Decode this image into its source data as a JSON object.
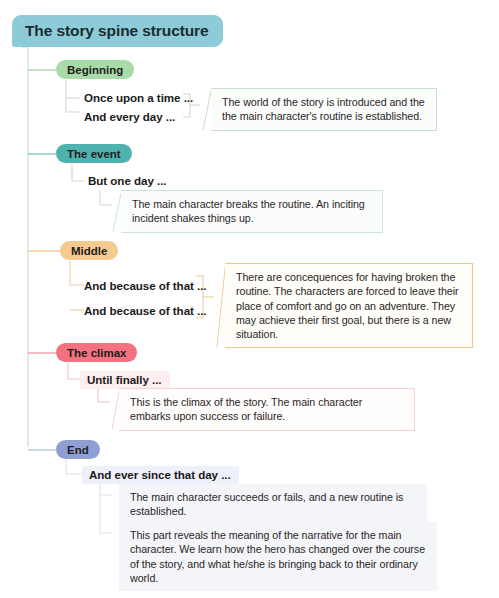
{
  "diagram": {
    "title": "The story spine structure",
    "root": {
      "label": "The story spine structure",
      "color": "#8ecbd9"
    },
    "stages": [
      {
        "id": "beginning",
        "label": "Beginning",
        "color": "#a8dba8",
        "line_color": "#a8cfa4",
        "beats": [
          "Once upon a time ...",
          "And every day ..."
        ],
        "notes": [
          "The world of the story is introduced and the the main character's routine is established."
        ]
      },
      {
        "id": "the-event",
        "label": "The event",
        "color": "#4eb3ae",
        "line_color": "#7cc3be",
        "beats": [
          "But one day ..."
        ],
        "notes": [
          "The main character breaks the routine.  An inciting incident shakes things up."
        ]
      },
      {
        "id": "middle",
        "label": "Middle",
        "color": "#f5ca8e",
        "line_color": "#eec88a",
        "beats": [
          "And because of that ...",
          "And because of that ..."
        ],
        "notes": [
          "There are concequences for having broken the routine. The characters are forced to leave their place of comfort and go on an adventure. They  may achieve their first goal, but there is a new situation."
        ]
      },
      {
        "id": "the-climax",
        "label": "The climax",
        "color": "#f4717f",
        "line_color": "#f09aa2",
        "beats": [
          "Until finally ..."
        ],
        "notes": [
          "This is the climax of the story. The main character embarks upon success or failure."
        ]
      },
      {
        "id": "end",
        "label": "End",
        "color": "#8e9fd4",
        "line_color": "#b5bfe2",
        "beats": [
          "And ever since that day ..."
        ],
        "notes": [
          "The main character succeeds or fails, and a new routine is established.",
          "This part reveals the meaning of the narrative for the main character. We learn how the hero has changed over the course of the story, and what he/she is bringing back to their ordinary world."
        ]
      }
    ],
    "spine_color": "#d3dbe0"
  }
}
